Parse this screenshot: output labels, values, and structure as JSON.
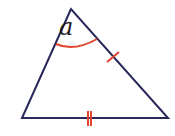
{
  "figure": {
    "type": "triangle",
    "vertices": {
      "apex": [
        71,
        9
      ],
      "bottom_left": [
        22,
        118
      ],
      "bottom_right": [
        168,
        118
      ]
    },
    "angle_label": "a",
    "angle_label_position": [
      58,
      14
    ],
    "markings": {
      "apex_angle_arc": "single arc at apex",
      "right_side_tick": "single tick mark on right side",
      "base_tick": "double tick mark on base"
    },
    "colors": {
      "edge": "#27275a",
      "marking": "#e0442e",
      "label": "#1a1a1a",
      "background": "#ffffff"
    }
  }
}
